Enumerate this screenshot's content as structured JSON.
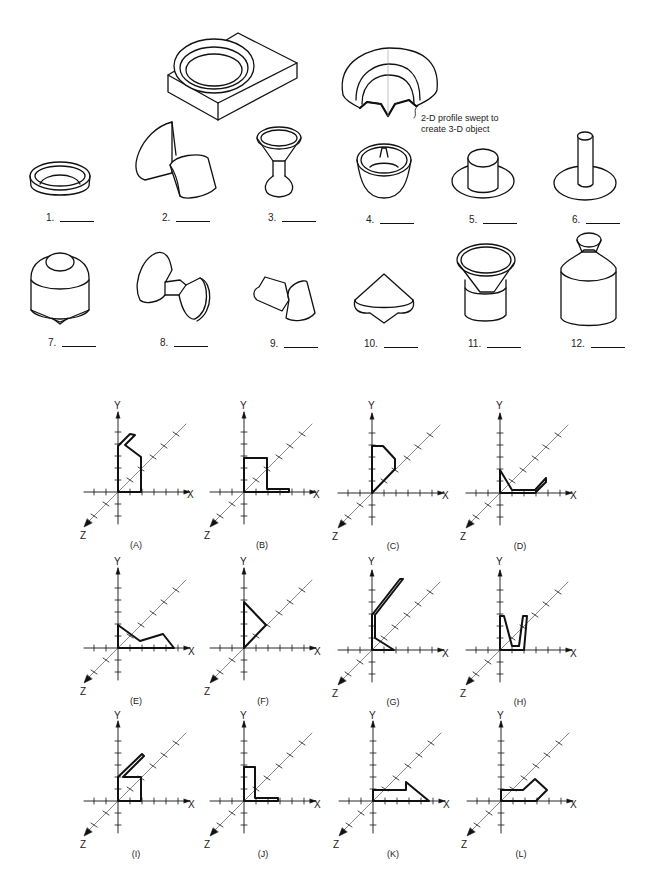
{
  "callout": {
    "line1": "2-D profile swept to",
    "line2": "create 3-D object"
  },
  "objects": [
    {
      "n": "1.",
      "x": 58,
      "y": 211
    },
    {
      "n": "2.",
      "x": 163,
      "y": 211
    },
    {
      "n": "3.",
      "x": 270,
      "y": 215
    },
    {
      "n": "4.",
      "x": 366,
      "y": 215
    },
    {
      "n": "5.",
      "x": 469,
      "y": 216
    },
    {
      "n": "6.",
      "x": 571,
      "y": 216
    },
    {
      "n": "7.",
      "x": 48,
      "y": 339
    },
    {
      "n": "8.",
      "x": 160,
      "y": 339
    },
    {
      "n": "9.",
      "x": 270,
      "y": 340
    },
    {
      "n": "10.",
      "x": 364,
      "y": 340
    },
    {
      "n": "11.",
      "x": 468,
      "y": 340
    },
    {
      "n": "12.",
      "x": 571,
      "y": 340
    }
  ],
  "axis_labels": {
    "x": "X",
    "y": "Y",
    "z": "Z"
  },
  "profiles": [
    {
      "label": "(A)",
      "ox": 118,
      "oy": 492
    },
    {
      "label": "(B)",
      "ox": 244,
      "oy": 492
    },
    {
      "label": "(C)",
      "ox": 372,
      "oy": 493
    },
    {
      "label": "(D)",
      "ox": 500,
      "oy": 493
    },
    {
      "label": "(E)",
      "ox": 118,
      "oy": 648
    },
    {
      "label": "(F)",
      "ox": 244,
      "oy": 648
    },
    {
      "label": "(G)",
      "ox": 372,
      "oy": 650
    },
    {
      "label": "(H)",
      "ox": 500,
      "oy": 650
    },
    {
      "label": "(I)",
      "ox": 118,
      "oy": 801
    },
    {
      "label": "(J)",
      "ox": 244,
      "oy": 801
    },
    {
      "label": "(K)",
      "ox": 373,
      "oy": 801
    },
    {
      "label": "(L)",
      "ox": 501,
      "oy": 801
    }
  ]
}
